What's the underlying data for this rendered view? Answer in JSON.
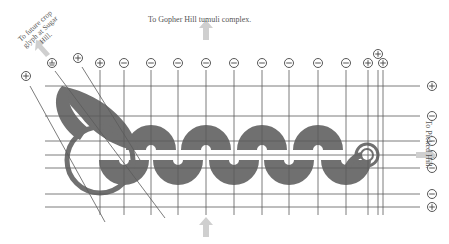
{
  "labels": {
    "top": "To Gopher Hill tumuli complex.",
    "top_left": "To future crop glyph at Sugar Hill.",
    "right": "To Picked Hill."
  },
  "colors": {
    "fill": "#707070",
    "line": "#5a5a5a",
    "arrow": "#cfcfcf",
    "text": "#555555"
  },
  "markers_top": [
    {
      "x": 26,
      "y": 76,
      "sign": "+"
    },
    {
      "x": 52,
      "y": 63,
      "sign": "⊥"
    },
    {
      "x": 78,
      "y": 58,
      "sign": "+"
    },
    {
      "x": 100,
      "y": 63,
      "sign": "+"
    },
    {
      "x": 124,
      "y": 63,
      "sign": "−"
    },
    {
      "x": 151,
      "y": 63,
      "sign": "−"
    },
    {
      "x": 178,
      "y": 63,
      "sign": "−"
    },
    {
      "x": 206,
      "y": 63,
      "sign": "−"
    },
    {
      "x": 234,
      "y": 63,
      "sign": "−"
    },
    {
      "x": 262,
      "y": 63,
      "sign": "−"
    },
    {
      "x": 289,
      "y": 63,
      "sign": "−"
    },
    {
      "x": 318,
      "y": 63,
      "sign": "−"
    },
    {
      "x": 346,
      "y": 63,
      "sign": "−"
    },
    {
      "x": 368,
      "y": 63,
      "sign": "+"
    },
    {
      "x": 378,
      "y": 54,
      "sign": "+"
    },
    {
      "x": 383,
      "y": 63,
      "sign": "+"
    }
  ],
  "markers_right": [
    {
      "y": 86,
      "sign": "+"
    },
    {
      "y": 116,
      "sign": "−"
    },
    {
      "y": 141,
      "sign": "−"
    },
    {
      "y": 155,
      "sign": "⊥"
    },
    {
      "y": 168,
      "sign": "−"
    },
    {
      "y": 194,
      "sign": "−"
    },
    {
      "y": 207,
      "sign": "+"
    }
  ],
  "gridlines_h": [
    86,
    116,
    141,
    155,
    168,
    194,
    207
  ],
  "gridlines_v": [
    100,
    124,
    151,
    178,
    206,
    234,
    262,
    289,
    318,
    346,
    368,
    378,
    383
  ],
  "upper_lobes": [
    151,
    206,
    262,
    318
  ],
  "lower_lobes": [
    124,
    178,
    234,
    289,
    346
  ],
  "arrows": [
    {
      "name": "arrow-up-top",
      "x": 206,
      "y": 28,
      "dir": "up"
    },
    {
      "name": "arrow-up-bottom",
      "x": 206,
      "y": 225,
      "dir": "up"
    },
    {
      "name": "arrow-up-left",
      "x": 42,
      "y": 50,
      "dir": "upleft"
    },
    {
      "name": "arrow-right",
      "x": 428,
      "y": 155,
      "dir": "right"
    }
  ]
}
